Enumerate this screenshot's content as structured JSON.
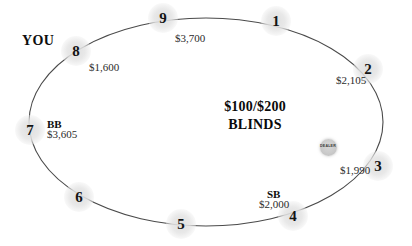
{
  "table": {
    "shape": "ellipse",
    "outline_color": "#4a4a4a",
    "background_color": "#ffffff",
    "center_text_line1": "$100/$200",
    "center_text_line2": "BLINDS"
  },
  "dealer_button": {
    "label": "DEALER",
    "at_seat": "3"
  },
  "seats": [
    {
      "number": "1",
      "stack": "",
      "position_tag": "",
      "x": 276,
      "y": 21,
      "stack_x": 0,
      "stack_y": 0,
      "tag_x": 0,
      "tag_y": 0
    },
    {
      "number": "2",
      "stack": "$2,105",
      "position_tag": "",
      "x": 368,
      "y": 69,
      "stack_x": 336,
      "stack_y": 75,
      "tag_x": 0,
      "tag_y": 0
    },
    {
      "number": "3",
      "stack": "$1,990",
      "position_tag": "",
      "x": 378,
      "y": 166,
      "stack_x": 340,
      "stack_y": 165,
      "tag_x": 0,
      "tag_y": 0
    },
    {
      "number": "4",
      "stack": "$2,000",
      "position_tag": "SB",
      "x": 293,
      "y": 216,
      "stack_x": 259,
      "stack_y": 199,
      "tag_x": 267,
      "tag_y": 189
    },
    {
      "number": "5",
      "stack": "",
      "position_tag": "",
      "x": 181,
      "y": 224,
      "stack_x": 0,
      "stack_y": 0,
      "tag_x": 0,
      "tag_y": 0
    },
    {
      "number": "6",
      "stack": "",
      "position_tag": "",
      "x": 79,
      "y": 197,
      "stack_x": 0,
      "stack_y": 0,
      "tag_x": 0,
      "tag_y": 0
    },
    {
      "number": "7",
      "stack": "$3,605",
      "position_tag": "BB",
      "x": 30,
      "y": 130,
      "stack_x": 47,
      "stack_y": 129,
      "tag_x": 47,
      "tag_y": 119
    },
    {
      "number": "8",
      "stack": "$1,600",
      "position_tag": "YOU",
      "x": 76,
      "y": 51,
      "stack_x": 89,
      "stack_y": 62,
      "tag_x": 22,
      "tag_y": 34
    },
    {
      "number": "9",
      "stack": "$3,700",
      "position_tag": "",
      "x": 163,
      "y": 18,
      "stack_x": 175,
      "stack_y": 33,
      "tag_x": 0,
      "tag_y": 0
    }
  ]
}
